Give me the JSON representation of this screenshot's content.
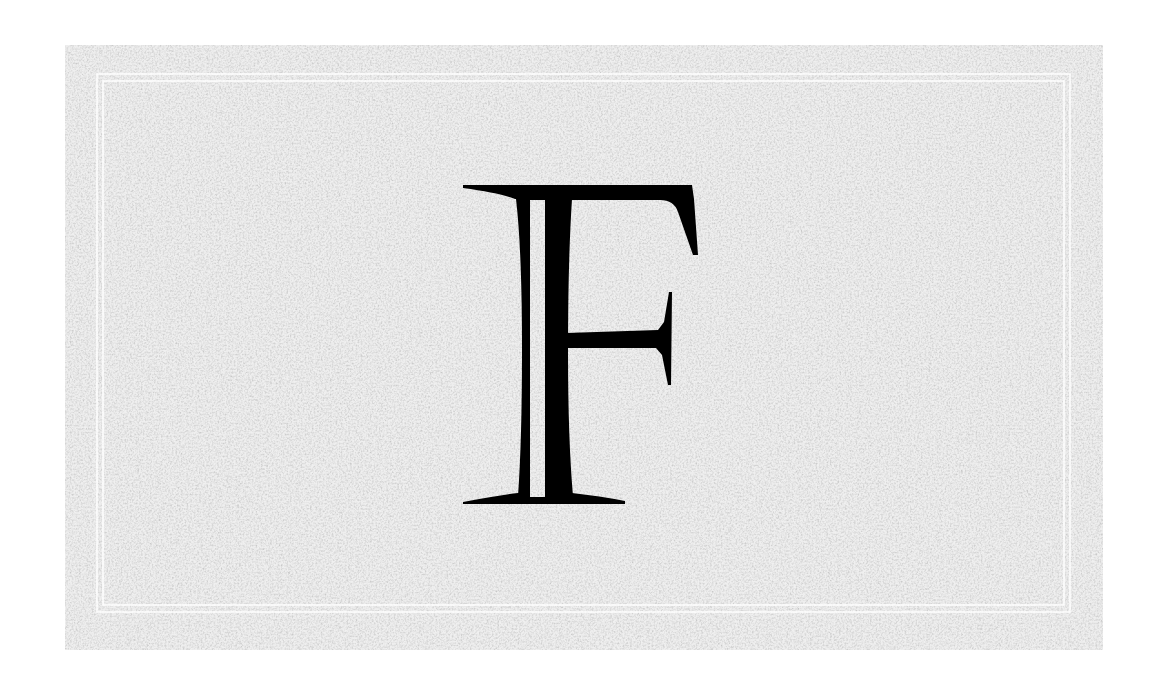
{
  "image": {
    "background_color": "#ffffff",
    "card": {
      "texture": "paper-grain",
      "base_color": "#e6e6e6",
      "frame": "double-white-rule"
    },
    "letter": {
      "glyph": "F",
      "style": "decorative inline serif capital",
      "color": "#000000"
    }
  }
}
